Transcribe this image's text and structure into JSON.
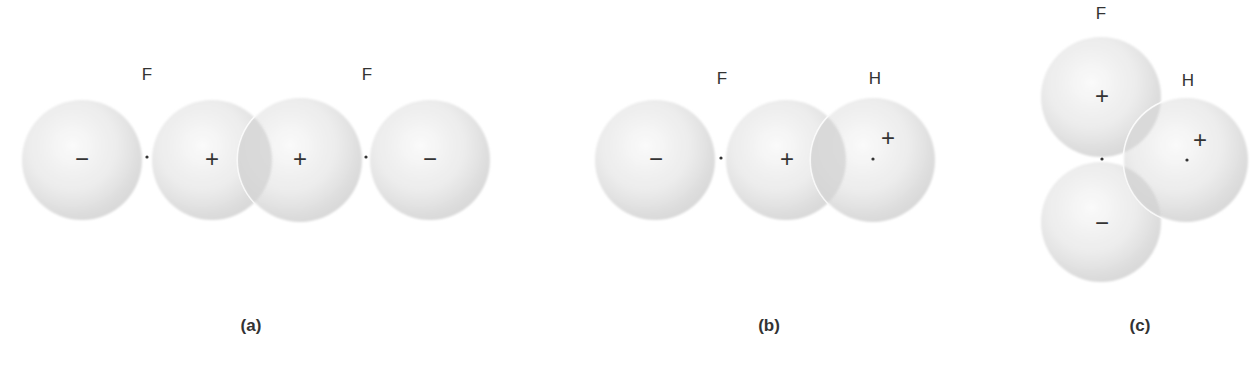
{
  "figure": {
    "colors": {
      "sphere_center": "#f7f7f7",
      "sphere_edge": "#dcdcdc",
      "overlap_shade": "#d2d2d2",
      "rim": "#ffffff",
      "ink": "#333333"
    },
    "panels": [
      {
        "id": "a",
        "label": "(a)",
        "label_pos": [
          251,
          325
        ],
        "atom_labels": [
          {
            "text": "F",
            "x": 147,
            "y": 74
          },
          {
            "text": "F",
            "x": 367,
            "y": 74
          }
        ],
        "spheres": [
          {
            "cx": 82,
            "cy": 160,
            "r": 60,
            "sign": "−",
            "sx": 82,
            "sy": 160
          },
          {
            "cx": 212,
            "cy": 160,
            "r": 60,
            "sign": "+",
            "sx": 212,
            "sy": 160
          },
          {
            "cx": 300,
            "cy": 160,
            "r": 62,
            "sign": "+",
            "sx": 300,
            "sy": 160,
            "overlaps": true
          },
          {
            "cx": 430,
            "cy": 160,
            "r": 60,
            "sign": "−",
            "sx": 430,
            "sy": 160
          }
        ],
        "nuclei": [
          [
            147,
            157
          ],
          [
            366,
            157
          ]
        ]
      },
      {
        "id": "b",
        "label": "(b)",
        "label_pos": [
          769,
          325
        ],
        "atom_labels": [
          {
            "text": "F",
            "x": 722,
            "y": 78
          },
          {
            "text": "H",
            "x": 875,
            "y": 78
          }
        ],
        "spheres": [
          {
            "cx": 655,
            "cy": 160,
            "r": 60,
            "sign": "−",
            "sx": 656,
            "sy": 160
          },
          {
            "cx": 786,
            "cy": 160,
            "r": 60,
            "sign": "+",
            "sx": 787,
            "sy": 160
          },
          {
            "cx": 873,
            "cy": 160,
            "r": 62,
            "sign": "+",
            "sx": 888,
            "sy": 139,
            "overlaps": true
          }
        ],
        "nuclei": [
          [
            721,
            158
          ],
          [
            873,
            159
          ]
        ]
      },
      {
        "id": "c",
        "label": "(c)",
        "label_pos": [
          1140,
          325
        ],
        "atom_labels": [
          {
            "text": "F",
            "x": 1101,
            "y": 13
          },
          {
            "text": "H",
            "x": 1188,
            "y": 80
          }
        ],
        "spheres": [
          {
            "cx": 1101,
            "cy": 97,
            "r": 60,
            "sign": "+",
            "sx": 1102,
            "sy": 97
          },
          {
            "cx": 1101,
            "cy": 222,
            "r": 60,
            "sign": "−",
            "sx": 1102,
            "sy": 224
          },
          {
            "cx": 1186,
            "cy": 160,
            "r": 62,
            "sign": "+",
            "sx": 1200,
            "sy": 141,
            "overlaps": true
          }
        ],
        "nuclei": [
          [
            1102,
            159
          ],
          [
            1187,
            160
          ]
        ]
      }
    ]
  }
}
